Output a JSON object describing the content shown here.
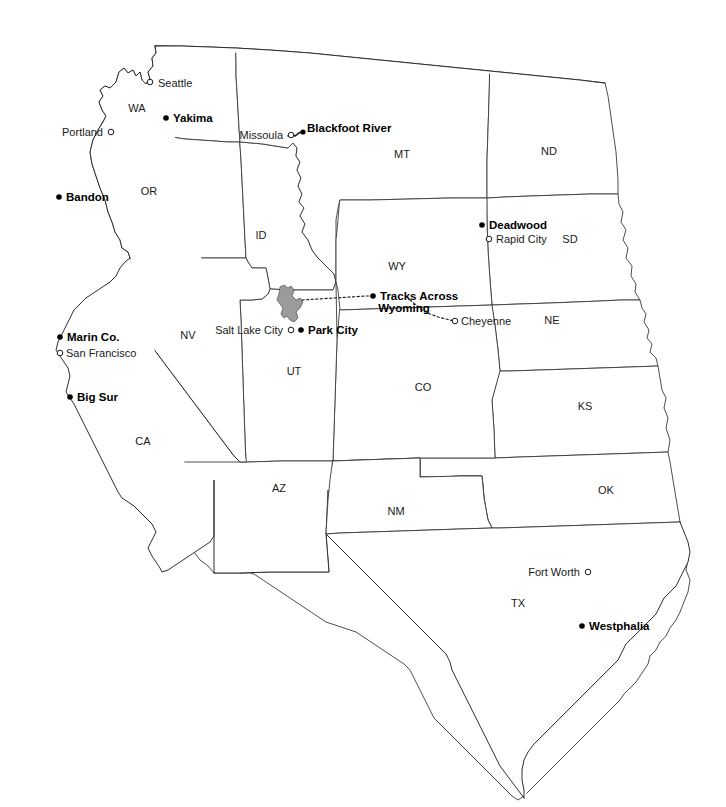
{
  "map": {
    "title": "Western United States reference map",
    "background_color": "#ffffff",
    "border_color": "#3a3a3a",
    "lake_fill_color": "#9b9b9b",
    "route_color": "#1a1a1a",
    "states": [
      {
        "abbr": "WA",
        "x": 137,
        "y": 109
      },
      {
        "abbr": "OR",
        "x": 149,
        "y": 192
      },
      {
        "abbr": "ID",
        "x": 261,
        "y": 236
      },
      {
        "abbr": "MT",
        "x": 402,
        "y": 155
      },
      {
        "abbr": "ND",
        "x": 549,
        "y": 152
      },
      {
        "abbr": "SD",
        "x": 570,
        "y": 240
      },
      {
        "abbr": "WY",
        "x": 397,
        "y": 267
      },
      {
        "abbr": "NE",
        "x": 552,
        "y": 321
      },
      {
        "abbr": "NV",
        "x": 188,
        "y": 336
      },
      {
        "abbr": "UT",
        "x": 294,
        "y": 372
      },
      {
        "abbr": "CO",
        "x": 423,
        "y": 388
      },
      {
        "abbr": "KS",
        "x": 585,
        "y": 407
      },
      {
        "abbr": "CA",
        "x": 143,
        "y": 442
      },
      {
        "abbr": "AZ",
        "x": 279,
        "y": 489
      },
      {
        "abbr": "NM",
        "x": 396,
        "y": 512
      },
      {
        "abbr": "OK",
        "x": 606,
        "y": 491
      },
      {
        "abbr": "TX",
        "x": 518,
        "y": 604
      }
    ],
    "cities": [
      {
        "name": "Seattle",
        "style": "minor",
        "marker": "open-circle",
        "label_x": 158,
        "label_y": 84,
        "label_anchor": "start",
        "dot_x": 150,
        "dot_y": 82
      },
      {
        "name": "Yakima",
        "style": "major",
        "marker": "filled-dot",
        "label_x": 173,
        "label_y": 119,
        "label_anchor": "start",
        "dot_x": 166,
        "dot_y": 118
      },
      {
        "name": "Portland",
        "style": "minor",
        "marker": "open-circle",
        "label_x": 103,
        "label_y": 133,
        "label_anchor": "end",
        "dot_x": 111,
        "dot_y": 132
      },
      {
        "name": "Bandon",
        "style": "major",
        "marker": "filled-dot",
        "label_x": 66,
        "label_y": 198,
        "label_anchor": "start",
        "dot_x": 59,
        "dot_y": 197
      },
      {
        "name": "Missoula",
        "style": "minor",
        "marker": "open-circle",
        "label_x": 283,
        "label_y": 136,
        "label_anchor": "end",
        "dot_x": 291,
        "dot_y": 135
      },
      {
        "name": "Blackfoot River",
        "style": "major",
        "marker": "river-dot",
        "label_x": 307,
        "label_y": 129,
        "label_anchor": "start",
        "dot_x": 303,
        "dot_y": 132
      },
      {
        "name": "Deadwood",
        "style": "major",
        "marker": "filled-dot",
        "label_x": 489,
        "label_y": 226,
        "label_anchor": "start",
        "dot_x": 482,
        "dot_y": 225
      },
      {
        "name": "Rapid City",
        "style": "minor",
        "marker": "open-circle",
        "label_x": 496,
        "label_y": 240,
        "label_anchor": "start",
        "dot_x": 489,
        "dot_y": 239
      },
      {
        "name": "Marin Co.",
        "style": "major",
        "marker": "filled-dot",
        "label_x": 67,
        "label_y": 338,
        "label_anchor": "start",
        "dot_x": 60,
        "dot_y": 337
      },
      {
        "name": "San Francisco",
        "style": "minor",
        "marker": "open-circle",
        "label_x": 66,
        "label_y": 354,
        "label_anchor": "start",
        "dot_x": 60,
        "dot_y": 353
      },
      {
        "name": "Big Sur",
        "style": "major",
        "marker": "filled-dot",
        "label_x": 77,
        "label_y": 398,
        "label_anchor": "start",
        "dot_x": 70,
        "dot_y": 397
      },
      {
        "name": "Salt Lake City",
        "style": "minor",
        "marker": "open-circle",
        "label_x": 283,
        "label_y": 331,
        "label_anchor": "end",
        "dot_x": 291,
        "dot_y": 330
      },
      {
        "name": "Park City",
        "style": "major",
        "marker": "filled-dot",
        "label_x": 308,
        "label_y": 331,
        "label_anchor": "start",
        "dot_x": 301,
        "dot_y": 330
      },
      {
        "name": "Cheyenne",
        "style": "minor",
        "marker": "open-circle",
        "label_x": 461,
        "label_y": 322,
        "label_anchor": "start",
        "dot_x": 455,
        "dot_y": 321
      },
      {
        "name": "Fort Worth",
        "style": "minor",
        "marker": "open-circle",
        "label_x": 580,
        "label_y": 573,
        "label_anchor": "end",
        "dot_x": 588,
        "dot_y": 572
      },
      {
        "name": "Westphalia",
        "style": "major",
        "marker": "filled-dot",
        "label_x": 589,
        "label_y": 627,
        "label_anchor": "start",
        "dot_x": 582,
        "dot_y": 626
      }
    ],
    "route_label": {
      "line1": "Tracks Across",
      "line2": "Wyoming",
      "x1": 380,
      "y1": 297,
      "x2": 404,
      "y2": 309,
      "dot_x": 373,
      "dot_y": 296
    }
  }
}
